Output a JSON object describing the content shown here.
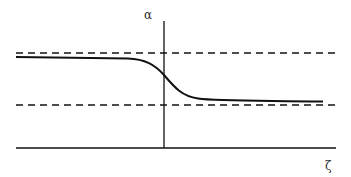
{
  "diagram": {
    "y_axis_label": "α",
    "x_axis_label": "ζ",
    "colors": {
      "stroke": "#111111",
      "background": "#ffffff",
      "label": "#333333"
    },
    "elements": [
      {
        "name": "upper-asymptote",
        "style": "dashed",
        "y": 53
      },
      {
        "name": "lower-asymptote",
        "style": "dashed",
        "y": 105
      },
      {
        "name": "transition-curve",
        "style": "solid",
        "description": "sigmoid drop from upper to lower level across vertical axis"
      }
    ]
  }
}
